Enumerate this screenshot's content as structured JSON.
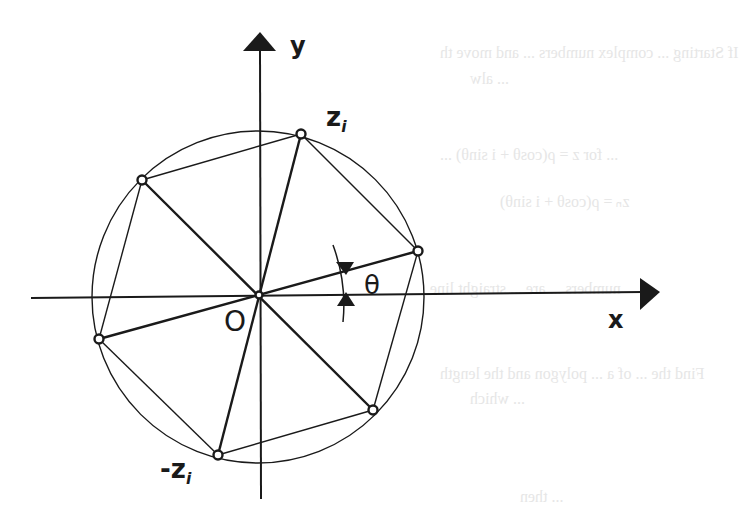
{
  "figure": {
    "axes": {
      "x_label": "x",
      "y_label": "y",
      "origin_label": "O",
      "origin": [
        259,
        295
      ]
    },
    "circle": {
      "cx": 258,
      "cy": 297,
      "r": 166
    },
    "points": [
      {
        "id": "z_i",
        "label": "z",
        "sub": "i",
        "x": 301,
        "y": 134
      },
      {
        "id": "right",
        "label": "",
        "x": 418,
        "y": 251
      },
      {
        "id": "lower-right",
        "label": "",
        "x": 373,
        "y": 410
      },
      {
        "id": "neg_z_i",
        "label": "-z",
        "sub": "i",
        "x": 218,
        "y": 455
      },
      {
        "id": "left",
        "label": "",
        "x": 99,
        "y": 339
      },
      {
        "id": "upper-left",
        "label": "",
        "x": 142,
        "y": 180
      }
    ],
    "angle_label": "θ",
    "stroke_color": "#1a1a1a",
    "ghost_text": [
      "If Starting ... complex numbers ... and move th",
      "... alw",
      "... for z = ρ(cosθ + i sinθ) ...",
      "zₙ = ρ(cosθ + i sinθ)",
      "numbers ... are ... straight line",
      "Find the ... of a ... polygon and the length",
      "... which",
      "... then"
    ]
  }
}
